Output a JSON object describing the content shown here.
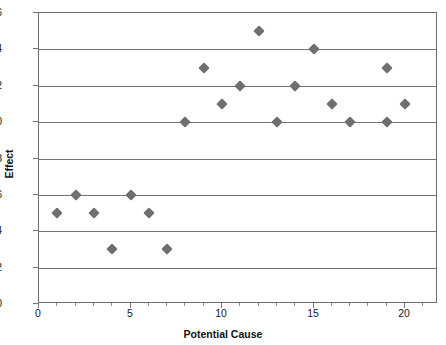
{
  "chart_data": {
    "type": "scatter",
    "title": "",
    "xlabel": "Potential Cause",
    "ylabel": "Effect",
    "xlim": [
      0,
      21.8
    ],
    "ylim": [
      0,
      16
    ],
    "xticks": [
      0,
      5,
      10,
      15,
      20
    ],
    "yticks": [
      0,
      2,
      4,
      6,
      8,
      10,
      12,
      14,
      16
    ],
    "xtick_labels": [
      "0",
      "5",
      "10",
      "15",
      "20"
    ],
    "ytick_labels": [
      "0",
      "2",
      "4",
      "6",
      "8",
      "10",
      "12",
      "14",
      "16"
    ],
    "grid": "horizontal",
    "legend": "none",
    "marker": "diamond",
    "marker_color": "#6f6f6f",
    "frame_color": "#6d6d6d",
    "gridline_color": "#757575",
    "series": [
      {
        "name": "Effect vs Potential Cause",
        "points": [
          {
            "x": 1,
            "y": 5
          },
          {
            "x": 2,
            "y": 6
          },
          {
            "x": 3,
            "y": 5
          },
          {
            "x": 4,
            "y": 3
          },
          {
            "x": 5,
            "y": 6
          },
          {
            "x": 6,
            "y": 5
          },
          {
            "x": 7,
            "y": 3
          },
          {
            "x": 8,
            "y": 10
          },
          {
            "x": 9,
            "y": 13
          },
          {
            "x": 10,
            "y": 11
          },
          {
            "x": 11,
            "y": 12
          },
          {
            "x": 12,
            "y": 15
          },
          {
            "x": 13,
            "y": 10
          },
          {
            "x": 14,
            "y": 12
          },
          {
            "x": 15,
            "y": 14
          },
          {
            "x": 16,
            "y": 11
          },
          {
            "x": 17,
            "y": 10
          },
          {
            "x": 19,
            "y": 13
          },
          {
            "x": 19,
            "y": 10
          },
          {
            "x": 20,
            "y": 11
          }
        ]
      }
    ]
  }
}
